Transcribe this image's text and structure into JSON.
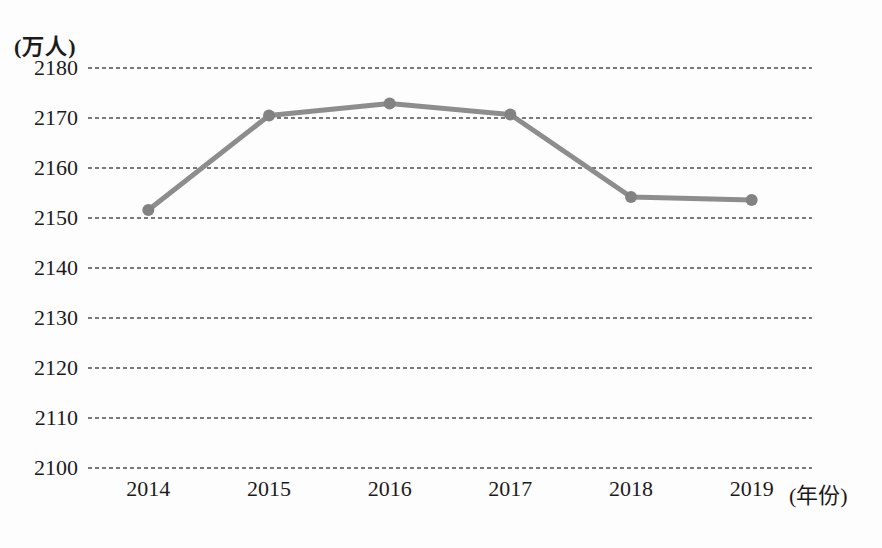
{
  "chart_data": {
    "type": "line",
    "title": "",
    "y_unit_label": "(万人)",
    "x_unit_label": "(年份)",
    "categories": [
      "2014",
      "2015",
      "2016",
      "2017",
      "2018",
      "2019"
    ],
    "series": [
      {
        "name": "population",
        "values": [
          2151.6,
          2170.5,
          2172.9,
          2170.7,
          2154.2,
          2153.6
        ]
      }
    ],
    "ylim": [
      2100,
      2180
    ],
    "yticks": [
      2180,
      2170,
      2160,
      2150,
      2140,
      2130,
      2120,
      2110,
      2100
    ],
    "grid": "horizontal-dashed",
    "legend": "none",
    "colors": {
      "line": "#8d8d8d",
      "marker": "#828282",
      "gridline": "#4d4d4d",
      "text": "#1b1b1b",
      "background": "#fdfdfd"
    }
  }
}
